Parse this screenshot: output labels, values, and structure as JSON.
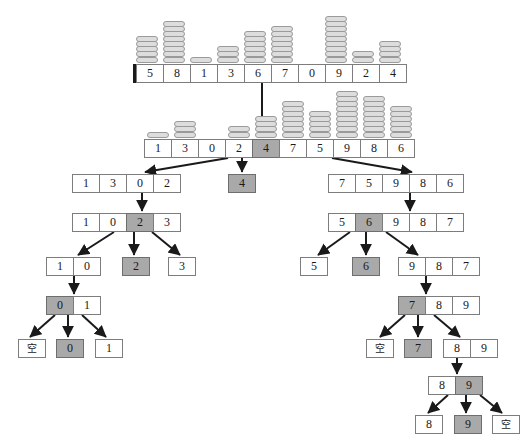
{
  "diagram": {
    "empty_label": "空",
    "colors": {
      "pivot_fill": "#a9a9a9",
      "cell_border": "#7d7d7d",
      "block_fill": "#dddddd",
      "edge": "#1a1a1a",
      "background": "#ffffff"
    }
  },
  "levels": [
    {
      "level": 0,
      "nodes": [
        {
          "id": "root",
          "x": 133,
          "y": 64,
          "values": [
            5,
            8,
            1,
            3,
            6,
            7,
            0,
            9,
            2,
            4
          ],
          "pivot_index": null,
          "thick_left_border": true,
          "towers": [
            5,
            8,
            1,
            3,
            6,
            7,
            0,
            9,
            2,
            4
          ]
        }
      ]
    },
    {
      "level": 1,
      "nodes": [
        {
          "id": "partitioned",
          "x": 144,
          "y": 139,
          "values": [
            1,
            3,
            0,
            2,
            4,
            7,
            5,
            9,
            8,
            6
          ],
          "pivot_index": 4,
          "thick_left_border": false,
          "towers": [
            1,
            3,
            0,
            2,
            4,
            7,
            5,
            9,
            8,
            6
          ]
        }
      ]
    },
    {
      "level": 2,
      "nodes": [
        {
          "id": "l2-left",
          "x": 72,
          "y": 174,
          "values": [
            1,
            3,
            0,
            2
          ],
          "pivot_index": null
        },
        {
          "id": "l2-mid",
          "x": 228,
          "y": 174,
          "values": [
            4
          ],
          "pivot_index": 0
        },
        {
          "id": "l2-right",
          "x": 328,
          "y": 174,
          "values": [
            7,
            5,
            9,
            8,
            6
          ],
          "pivot_index": null
        }
      ]
    },
    {
      "level": 3,
      "nodes": [
        {
          "id": "l3-left",
          "x": 72,
          "y": 213,
          "values": [
            1,
            0,
            2,
            3
          ],
          "pivot_index": 2
        },
        {
          "id": "l3-right",
          "x": 328,
          "y": 213,
          "values": [
            5,
            6,
            9,
            8,
            7
          ],
          "pivot_index": 1
        }
      ]
    },
    {
      "level": 4,
      "nodes": [
        {
          "id": "l4-a",
          "x": 46,
          "y": 257,
          "values": [
            1,
            0
          ],
          "pivot_index": null
        },
        {
          "id": "l4-b",
          "x": 122,
          "y": 257,
          "values": [
            2
          ],
          "pivot_index": 0
        },
        {
          "id": "l4-c",
          "x": 168,
          "y": 257,
          "values": [
            3
          ],
          "pivot_index": null
        },
        {
          "id": "l4-d",
          "x": 300,
          "y": 257,
          "values": [
            5
          ],
          "pivot_index": null
        },
        {
          "id": "l4-e",
          "x": 352,
          "y": 257,
          "values": [
            6
          ],
          "pivot_index": 0
        },
        {
          "id": "l4-f",
          "x": 398,
          "y": 257,
          "values": [
            9,
            8,
            7
          ],
          "pivot_index": null
        }
      ]
    },
    {
      "level": 5,
      "nodes": [
        {
          "id": "l5-a",
          "x": 46,
          "y": 296,
          "values": [
            0,
            1
          ],
          "pivot_index": 0
        },
        {
          "id": "l5-b",
          "x": 398,
          "y": 296,
          "values": [
            7,
            8,
            9
          ],
          "pivot_index": 0
        }
      ]
    },
    {
      "level": 6,
      "nodes": [
        {
          "id": "l6-a",
          "x": 18,
          "y": 339,
          "values": [
            "空"
          ],
          "pivot_index": null
        },
        {
          "id": "l6-b",
          "x": 56,
          "y": 339,
          "values": [
            0
          ],
          "pivot_index": 0
        },
        {
          "id": "l6-c",
          "x": 95,
          "y": 339,
          "values": [
            1
          ],
          "pivot_index": null
        },
        {
          "id": "l6-d",
          "x": 366,
          "y": 339,
          "values": [
            "空"
          ],
          "pivot_index": null
        },
        {
          "id": "l6-e",
          "x": 404,
          "y": 339,
          "values": [
            7
          ],
          "pivot_index": 0
        },
        {
          "id": "l6-f",
          "x": 443,
          "y": 339,
          "values": [
            8,
            9
          ],
          "pivot_index": null
        }
      ]
    },
    {
      "level": 7,
      "nodes": [
        {
          "id": "l7-a",
          "x": 428,
          "y": 376,
          "values": [
            8,
            9
          ],
          "pivot_index": 1
        }
      ]
    },
    {
      "level": 8,
      "nodes": [
        {
          "id": "l8-a",
          "x": 415,
          "y": 415,
          "values": [
            8
          ],
          "pivot_index": null
        },
        {
          "id": "l8-b",
          "x": 454,
          "y": 415,
          "values": [
            9
          ],
          "pivot_index": 0
        },
        {
          "id": "l8-c",
          "x": 492,
          "y": 415,
          "values": [
            "空"
          ],
          "pivot_index": null
        }
      ]
    }
  ],
  "edges": [
    {
      "from": "root",
      "to": "partitioned",
      "x1": 262,
      "y1": 83,
      "x2": 262,
      "y2": 137
    },
    {
      "from": "partitioned",
      "to": "l2-left",
      "x1": 228,
      "y1": 158,
      "x2": 145,
      "y2": 172
    },
    {
      "from": "partitioned",
      "to": "l2-mid",
      "x1": 242,
      "y1": 158,
      "x2": 242,
      "y2": 172
    },
    {
      "from": "partitioned",
      "to": "l2-right",
      "x1": 332,
      "y1": 158,
      "x2": 412,
      "y2": 172
    },
    {
      "from": "l2-left",
      "to": "l3-left",
      "x1": 142,
      "y1": 193,
      "x2": 142,
      "y2": 211
    },
    {
      "from": "l2-right",
      "to": "l3-right",
      "x1": 410,
      "y1": 193,
      "x2": 410,
      "y2": 211
    },
    {
      "from": "l3-left",
      "to": "l4-a",
      "x1": 114,
      "y1": 232,
      "x2": 78,
      "y2": 255
    },
    {
      "from": "l3-left",
      "to": "l4-b",
      "x1": 134,
      "y1": 232,
      "x2": 134,
      "y2": 255
    },
    {
      "from": "l3-left",
      "to": "l4-c",
      "x1": 152,
      "y1": 232,
      "x2": 180,
      "y2": 255
    },
    {
      "from": "l3-right",
      "to": "l4-d",
      "x1": 350,
      "y1": 232,
      "x2": 318,
      "y2": 255
    },
    {
      "from": "l3-right",
      "to": "l4-e",
      "x1": 366,
      "y1": 232,
      "x2": 366,
      "y2": 255
    },
    {
      "from": "l3-right",
      "to": "l4-f",
      "x1": 386,
      "y1": 232,
      "x2": 418,
      "y2": 255
    },
    {
      "from": "l4-a",
      "to": "l5-a",
      "x1": 74,
      "y1": 276,
      "x2": 74,
      "y2": 294
    },
    {
      "from": "l4-f",
      "to": "l5-b",
      "x1": 426,
      "y1": 276,
      "x2": 426,
      "y2": 294
    },
    {
      "from": "l5-a",
      "to": "l6-a",
      "x1": 55,
      "y1": 315,
      "x2": 30,
      "y2": 337
    },
    {
      "from": "l5-a",
      "to": "l6-b",
      "x1": 68,
      "y1": 315,
      "x2": 68,
      "y2": 337
    },
    {
      "from": "l5-a",
      "to": "l6-c",
      "x1": 82,
      "y1": 315,
      "x2": 106,
      "y2": 337
    },
    {
      "from": "l5-b",
      "to": "l6-d",
      "x1": 405,
      "y1": 315,
      "x2": 380,
      "y2": 337
    },
    {
      "from": "l5-b",
      "to": "l6-e",
      "x1": 418,
      "y1": 315,
      "x2": 418,
      "y2": 337
    },
    {
      "from": "l5-b",
      "to": "l6-f",
      "x1": 434,
      "y1": 315,
      "x2": 460,
      "y2": 337
    },
    {
      "from": "l6-f",
      "to": "l7-a",
      "x1": 457,
      "y1": 358,
      "x2": 457,
      "y2": 374
    },
    {
      "from": "l7-a",
      "to": "l8-a",
      "x1": 448,
      "y1": 395,
      "x2": 428,
      "y2": 413
    },
    {
      "from": "l7-a",
      "to": "l8-b",
      "x1": 466,
      "y1": 395,
      "x2": 466,
      "y2": 413
    },
    {
      "from": "l7-a",
      "to": "l8-c",
      "x1": 480,
      "y1": 395,
      "x2": 502,
      "y2": 413
    }
  ]
}
